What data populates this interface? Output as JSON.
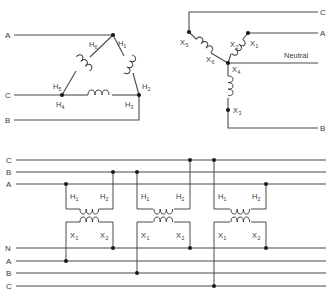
{
  "diagram": {
    "type": "electrical-wiring-diagram",
    "background_color": "#ffffff",
    "line_color": "#4a4a4a",
    "dot_color": "#1a1a1a"
  },
  "delta": {
    "name": "delta-connection",
    "line_labels": {
      "a": "A",
      "c": "C",
      "b": "B"
    },
    "terminals": {
      "h1": "H",
      "h1_sub": "1",
      "h2": "H",
      "h2_sub": "2",
      "h3": "H",
      "h3_sub": "3",
      "h4": "H",
      "h4_sub": "4",
      "h5": "H",
      "h5_sub": "5",
      "h6": "H",
      "h6_sub": "6"
    }
  },
  "wye": {
    "name": "wye-connection",
    "line_labels": {
      "c": "C",
      "a": "A",
      "b": "B",
      "neutral": "Neutral"
    },
    "terminals": {
      "x1": "X",
      "x1_sub": "1",
      "x2": "X",
      "x2_sub": "2",
      "x3": "X",
      "x3_sub": "3",
      "x4": "X",
      "x4_sub": "4",
      "x5": "X",
      "x5_sub": "5",
      "x6": "X",
      "x6_sub": "6"
    }
  },
  "bank": {
    "name": "transformer-bank-schematic",
    "primary_bus_labels": [
      "C",
      "B",
      "A"
    ],
    "secondary_bus_labels": [
      "N",
      "A",
      "B",
      "C"
    ],
    "transformers": [
      {
        "id": "transformer-1",
        "primary": {
          "h1": "H",
          "h1_sub": "1",
          "h2": "H",
          "h2_sub": "2",
          "h1_line": "A",
          "h2_line": "B"
        },
        "secondary": {
          "x1": "X",
          "x1_sub": "1",
          "x2": "X",
          "x2_sub": "2",
          "x1_line": "A",
          "x2_line": "N"
        }
      },
      {
        "id": "transformer-2",
        "primary": {
          "h1": "H",
          "h1_sub": "1",
          "h2": "H",
          "h2_sub": "2",
          "h1_line": "B",
          "h2_line": "C"
        },
        "secondary": {
          "x1": "X",
          "x1_sub": "1",
          "x2": "X",
          "x2_sub": "2",
          "x1_line": "B",
          "x2_line": "N"
        }
      },
      {
        "id": "transformer-3",
        "primary": {
          "h1": "H",
          "h1_sub": "1",
          "h2": "H",
          "h2_sub": "2",
          "h1_line": "C",
          "h2_line": "A"
        },
        "secondary": {
          "x1": "X",
          "x1_sub": "1",
          "x2": "X",
          "x2_sub": "2",
          "x1_line": "C",
          "x2_line": "N"
        }
      }
    ]
  }
}
